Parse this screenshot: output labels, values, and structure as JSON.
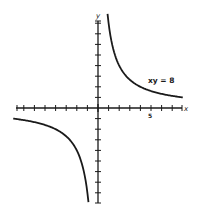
{
  "chart_data": {
    "type": "line",
    "title": "",
    "xlabel": "x",
    "ylabel": "y",
    "annotation": "xy = 8",
    "tick_label": "5",
    "grid": false,
    "legend": "none",
    "xlim": [
      -8,
      8
    ],
    "ylim": [
      -9,
      9
    ],
    "x_tick_step": 1,
    "y_tick_step": 1,
    "series": [
      {
        "name": "xy = 8 (first quadrant branch)",
        "x": [
          0.9,
          1,
          1.5,
          2,
          3,
          4,
          5,
          6,
          7,
          8
        ],
        "y": [
          8.9,
          8,
          5.33,
          4,
          2.67,
          2,
          1.6,
          1.33,
          1.14,
          1
        ]
      },
      {
        "name": "xy = 8 (third quadrant branch)",
        "x": [
          -8,
          -7,
          -6,
          -5,
          -4,
          -3,
          -2,
          -1.5,
          -1,
          -0.9
        ],
        "y": [
          -1,
          -1.14,
          -1.33,
          -1.6,
          -2,
          -2.67,
          -4,
          -5.33,
          -8,
          -8.9
        ]
      }
    ]
  },
  "labels": {
    "x_axis": "x",
    "y_axis": "y",
    "equation": "xy = 8",
    "tick_5": "5"
  }
}
